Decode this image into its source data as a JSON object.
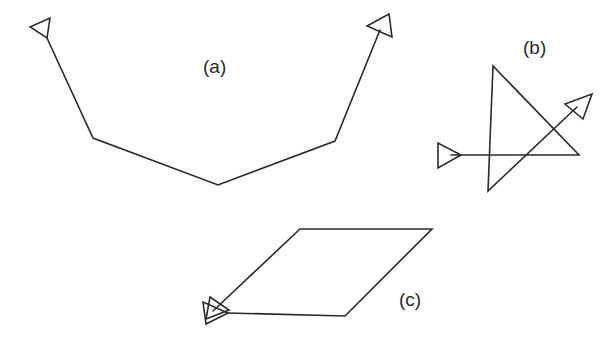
{
  "figure": {
    "stroke_color": "#2a2a2a",
    "background": "#ffffff",
    "panels": [
      {
        "id": "a",
        "label": "(a)",
        "label_pos": [
          203,
          57
        ],
        "path": [
          [
            47,
            38
          ],
          [
            93,
            138
          ],
          [
            218,
            185
          ],
          [
            335,
            141
          ],
          [
            380,
            30
          ]
        ],
        "arrowheads": [
          {
            "at": "start",
            "triangle": [
              [
                30,
                27
              ],
              [
                50,
                18
              ],
              [
                47,
                38
              ]
            ]
          },
          {
            "at": "end",
            "triangle": [
              [
                367,
                26
              ],
              [
                389,
                14
              ],
              [
                392,
                37
              ]
            ]
          }
        ]
      },
      {
        "id": "b",
        "label": "(b)",
        "label_pos": [
          523,
          38
        ],
        "path": [
          [
            451,
            155
          ],
          [
            579,
            155
          ],
          [
            493,
            66
          ],
          [
            488,
            191
          ],
          [
            577,
            107
          ]
        ],
        "arrowheads": [
          {
            "at": "start",
            "triangle": [
              [
                438,
                143
              ],
              [
                438,
                168
              ],
              [
                461,
                155
              ]
            ]
          },
          {
            "at": "end",
            "triangle": [
              [
                565,
                104
              ],
              [
                592,
                94
              ],
              [
                583,
                119
              ]
            ]
          }
        ]
      },
      {
        "id": "c",
        "label": "(c)",
        "label_pos": [
          399,
          290
        ],
        "path": [
          [
            228,
            313
          ],
          [
            345,
            316
          ],
          [
            432,
            229
          ],
          [
            300,
            229
          ],
          [
            213,
            311
          ]
        ],
        "arrowheads": [
          {
            "at": "start",
            "triangle": [
              [
                203,
                302
              ],
              [
                206,
                324
              ],
              [
                228,
                313
              ]
            ]
          },
          {
            "at": "end",
            "triangle": [
              [
                210,
                297
              ],
              [
                229,
                310
              ],
              [
                206,
                319
              ]
            ]
          }
        ]
      }
    ]
  }
}
